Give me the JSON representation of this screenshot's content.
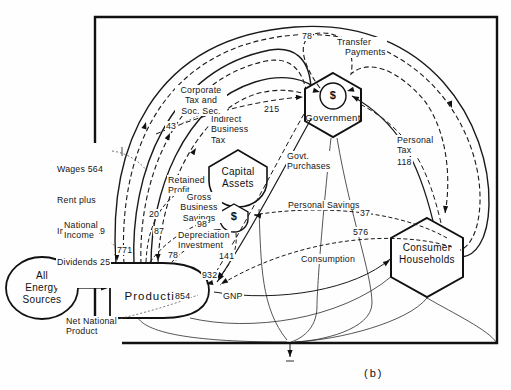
{
  "caption": "(b)",
  "nodes": {
    "energy": "All\nEnergy\nSources",
    "production": "Production",
    "government": "Government",
    "gov_symbol": "$",
    "capital_assets": "Capital\nAssets",
    "pool_symbol": "$",
    "households": "Consumer\nHouseholds"
  },
  "flows": {
    "factor_payments": [
      "Wages 564",
      "Rent plus",
      "Interest 119",
      "Dividends 25"
    ],
    "national_income": {
      "label": "National\nIncome",
      "value": "771"
    },
    "net_national_product": {
      "label": "Net National\nProduct",
      "value": "854"
    },
    "gnp": {
      "label": "GNP",
      "value": "932"
    },
    "retained_profit": {
      "label": "Retained\nProfit",
      "value": "20"
    },
    "indirect_business_tax": {
      "label": "Indirect\nBusiness\nTax",
      "value": "87"
    },
    "corporate_tax": {
      "label": "Corporate\nTax and\nSoc. Sec.",
      "value": "43"
    },
    "transfer_payments": {
      "label": "Transfer\n   Payments",
      "value": "78"
    },
    "government_purchases": {
      "label": "Govt.\nPurchases",
      "value": "215"
    },
    "personal_tax": {
      "label": "Personal\nTax",
      "value": "118"
    },
    "personal_savings": {
      "label": "Personal Savings",
      "value": "37"
    },
    "consumption": {
      "label": "Consumption",
      "value": "576"
    },
    "gross_business_savings": {
      "label": "Gross\nBusiness\nSavings",
      "value": "98"
    },
    "depreciation": {
      "label": "Depreciation\nInvestment",
      "value": "78"
    },
    "investment_value": "141"
  },
  "colors": {
    "ink": "#1a1a1a",
    "background": "#fefefe"
  }
}
